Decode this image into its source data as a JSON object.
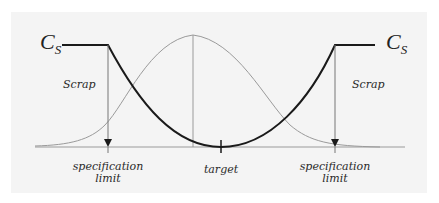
{
  "diagram": {
    "labels": {
      "cost_left_main": "C",
      "cost_left_sub": "S",
      "cost_right_main": "C",
      "cost_right_sub": "S",
      "scrap_left": "Scrap",
      "scrap_right": "Scrap",
      "spec_left_line1": "specification",
      "spec_left_line2": "limit",
      "spec_right_line1": "specification",
      "spec_right_line2": "limit",
      "target": "target"
    },
    "elements": [
      {
        "name": "normal-distribution-curve",
        "color": "#9a9a9a",
        "peak_x": 193
      },
      {
        "name": "loss-function-curve",
        "color": "#1a1a1a",
        "minimum_at": "target"
      },
      {
        "name": "baseline-axis",
        "color": "#9a9a9a"
      },
      {
        "name": "spec-limit-arrow-left"
      },
      {
        "name": "spec-limit-arrow-right"
      }
    ],
    "colors": {
      "panel_background": "#f4f4f4",
      "loss_curve": "#1a1a1a",
      "distribution_curve": "#9a9a9a",
      "text": "#2a2a2a"
    }
  }
}
